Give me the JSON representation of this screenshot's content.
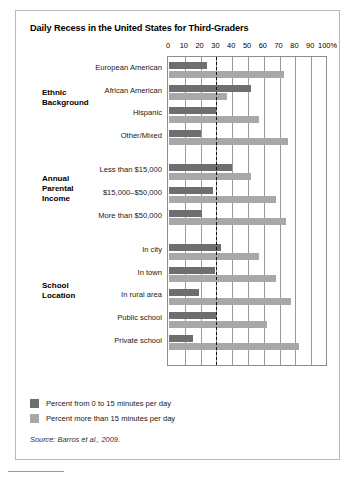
{
  "figure": {
    "title": "Daily Recess in the United States for Third-Graders",
    "source": "Source: Barros et al., 2009."
  },
  "legend": {
    "items": [
      {
        "label": "Percent from 0 to 15 minutes per day",
        "color": "#6e6e6e",
        "key": "dark"
      },
      {
        "label": "Percent more than 15 minutes per day",
        "color": "#a8a8a8",
        "key": "light"
      }
    ]
  },
  "groups": [
    {
      "name": "Ethnic\nBackground"
    },
    {
      "name": "Annual\nParental\nIncome"
    },
    {
      "name": "School\nLocation"
    }
  ],
  "chart_data": {
    "type": "bar",
    "orientation": "horizontal",
    "title": "Daily Recess in the United States for Third-Graders",
    "xlabel": "",
    "ylabel": "",
    "xlim": [
      0,
      100
    ],
    "xticks": [
      0,
      10,
      20,
      30,
      40,
      50,
      60,
      70,
      80,
      90,
      100
    ],
    "xtick_labels": [
      "0",
      "10",
      "20",
      "30",
      "40",
      "50",
      "60",
      "70",
      "80",
      "90",
      "100%"
    ],
    "grid": true,
    "reference_line": {
      "value": 30,
      "style": "dashed",
      "color": "#111111"
    },
    "legend_position": "below-plot",
    "categories": [
      "European American",
      "African American",
      "Hispanic",
      "Other/Mixed",
      "Less than $15,000",
      "$15,000–$50,000",
      "More than $50,000",
      "In city",
      "In town",
      "In rural area",
      "Public school",
      "Private school"
    ],
    "category_groups": [
      {
        "label": "Ethnic Background",
        "categories": [
          "European American",
          "African American",
          "Hispanic",
          "Other/Mixed"
        ]
      },
      {
        "label": "Annual Parental Income",
        "categories": [
          "Less than $15,000",
          "$15,000–$50,000",
          "More than $50,000"
        ]
      },
      {
        "label": "School Location",
        "categories": [
          "In city",
          "In town",
          "In rural area",
          "Public school",
          "Private school"
        ]
      }
    ],
    "series": [
      {
        "name": "Percent from 0 to 15 minutes per day",
        "color": "#6e6e6e",
        "values": [
          24,
          52,
          30,
          20,
          40,
          28,
          21,
          33,
          29,
          19,
          30,
          15
        ]
      },
      {
        "name": "Percent more than 15 minutes per day",
        "color": "#a8a8a8",
        "values": [
          73,
          37,
          57,
          75,
          52,
          68,
          74,
          57,
          68,
          77,
          62,
          82
        ]
      }
    ]
  }
}
